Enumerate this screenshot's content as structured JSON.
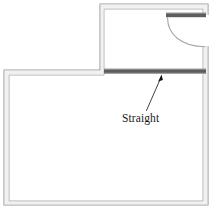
{
  "diagram": {
    "type": "architectural-floor-plan",
    "title": "",
    "background_color": "#ffffff",
    "wall_line_color": "#8c8c8c",
    "wall_fill_color": "#ffffff",
    "thick_wall_color": "#595959",
    "annotation_color": "#1a1a1a",
    "arc_color": "#8c8c8c"
  },
  "annotations": [
    {
      "id": "straight-label",
      "label": "Straight",
      "x": 122,
      "y": 112,
      "leader": {
        "from_x": 146,
        "from_y": 110,
        "to_x": 161,
        "to_y": 76
      }
    }
  ],
  "rooms": [
    {
      "id": "upper-room",
      "name": "upper-room",
      "x": 100,
      "y": 4,
      "width": 108,
      "height": 70
    },
    {
      "id": "lower-room",
      "name": "lower-room",
      "x": 4,
      "y": 70,
      "width": 204,
      "height": 135
    }
  ],
  "features": [
    {
      "id": "straight-wall",
      "type": "thick-wall",
      "orientation": "horizontal",
      "x1": 104,
      "y1": 69,
      "x2": 206,
      "y2": 73
    },
    {
      "id": "door-lintel",
      "type": "thick-wall",
      "orientation": "horizontal",
      "x1": 167,
      "y1": 13,
      "x2": 206,
      "y2": 17
    },
    {
      "id": "door-swing",
      "type": "door-arc",
      "pivot_x": 167,
      "pivot_y": 17,
      "radius": 39,
      "start_x": 167,
      "start_y": 17,
      "end_x": 206,
      "end_y": 47
    },
    {
      "id": "door-opening",
      "type": "wall-gap",
      "orientation": "vertical",
      "x": 204,
      "y1": 14,
      "y2": 46
    }
  ]
}
